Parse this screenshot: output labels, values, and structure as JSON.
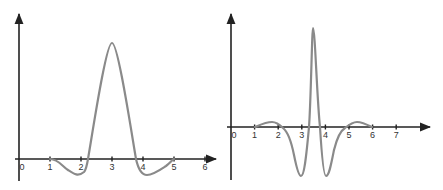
{
  "chart_data": [
    {
      "type": "line",
      "title": "",
      "xlabel": "",
      "ylabel": "",
      "x_ticks": [
        "0",
        "1",
        "2",
        "3",
        "4",
        "5",
        "6"
      ],
      "xlim": [
        0,
        6.4
      ],
      "grid": false,
      "legend": null,
      "series": [
        {
          "name": "wavelet",
          "x": [
            1.0,
            1.5,
            1.9,
            2.15,
            2.5,
            3.0,
            3.5,
            3.85,
            4.0,
            4.3,
            4.7,
            5.0
          ],
          "y": [
            0.0,
            -0.1,
            -0.14,
            0.0,
            0.45,
            1.0,
            0.45,
            0.0,
            -0.1,
            -0.14,
            -0.08,
            0.0
          ]
        }
      ],
      "colors": {
        "axis": "#222222",
        "curve": "#8a8a8a"
      }
    },
    {
      "type": "line",
      "title": "",
      "xlabel": "",
      "ylabel": "",
      "x_ticks": [
        "0",
        "1",
        "2",
        "3",
        "4",
        "5",
        "6",
        "7"
      ],
      "xlim": [
        0,
        8.5
      ],
      "grid": false,
      "legend": null,
      "series": [
        {
          "name": "wavelet",
          "x": [
            1.0,
            1.4,
            1.8,
            2.1,
            2.5,
            3.0,
            3.25,
            3.5,
            3.75,
            4.0,
            4.5,
            4.9,
            5.3,
            5.7,
            6.0
          ],
          "y": [
            0.0,
            0.04,
            0.05,
            0.0,
            -0.25,
            -0.5,
            0.0,
            1.0,
            0.0,
            -0.5,
            -0.25,
            0.0,
            0.05,
            0.04,
            0.0
          ]
        }
      ],
      "colors": {
        "axis": "#222222",
        "curve": "#8a8a8a"
      }
    }
  ]
}
